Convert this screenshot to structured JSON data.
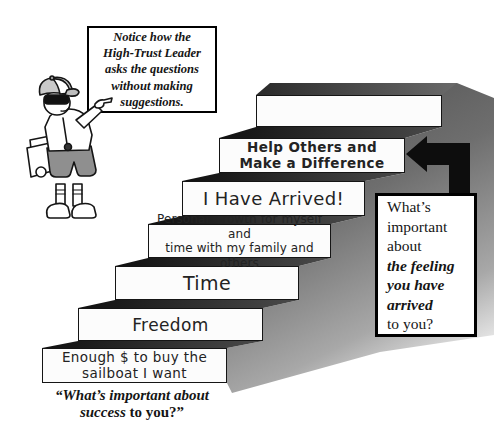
{
  "notice_box": {
    "lines": [
      "Notice how the",
      "High-Trust Leader",
      "asks the questions",
      "without making",
      "suggestions."
    ]
  },
  "stairs": [
    {
      "name": "enough-money",
      "lines": [
        "Enough $ to buy the",
        "sailboat I want"
      ]
    },
    {
      "name": "freedom",
      "lines": [
        "Freedom"
      ]
    },
    {
      "name": "time",
      "lines": [
        "Time"
      ]
    },
    {
      "name": "personal-growth",
      "lines": [
        "Personal Growth for myself and",
        "time with my family and others"
      ]
    },
    {
      "name": "i-have-arrived",
      "lines": [
        "I Have Arrived!"
      ]
    },
    {
      "name": "help-others",
      "lines": [
        "Help Others and",
        "Make a Difference"
      ]
    },
    {
      "name": "top-empty",
      "lines": []
    }
  ],
  "question_box": {
    "lines": [
      "What’s",
      "important",
      "about",
      "the feeling",
      "you have",
      "arrived",
      "to you?"
    ],
    "emphasis": [
      false,
      false,
      false,
      true,
      true,
      true,
      false
    ]
  },
  "bottom_quote": {
    "italic_part": "“What’s important about",
    "italic_part2": "success",
    "regular_part": " to you?”"
  },
  "colors": {
    "arrow": "#0d0d0d",
    "step_fill": "#fcfcfc",
    "step_border": "#151515",
    "shadow_dark": "#4f4f4f",
    "gap_dark": "#101010",
    "shorts_gray": "#8f8f8f"
  }
}
